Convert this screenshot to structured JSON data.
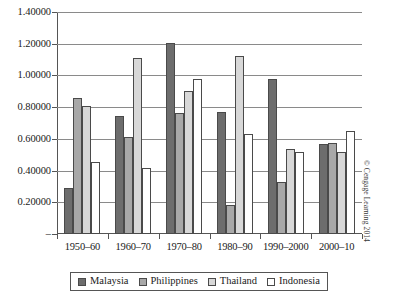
{
  "chart_data": {
    "type": "bar",
    "title": "",
    "subtitle": "",
    "xlabel": "",
    "ylabel": "",
    "categories": [
      "1950–60",
      "1960–70",
      "1970–80",
      "1980–90",
      "1990–2000",
      "2000–10"
    ],
    "series": [
      {
        "name": "Malaysia",
        "color": "#6d6d6d",
        "values": [
          0.29,
          0.745,
          1.205,
          0.77,
          0.98,
          0.565
        ]
      },
      {
        "name": "Philippines",
        "color": "#a8a8a8",
        "values": [
          0.855,
          0.61,
          0.765,
          0.18,
          0.33,
          0.575
        ]
      },
      {
        "name": "Thailand",
        "color": "#d8d8d8",
        "values": [
          0.805,
          1.11,
          0.9,
          1.12,
          0.535,
          0.515
        ]
      },
      {
        "name": "Indonesia",
        "color": "#ffffff",
        "values": [
          0.455,
          0.415,
          0.975,
          0.63,
          0.52,
          0.65
        ]
      }
    ],
    "ylim": [
      0,
      1.4
    ],
    "yticks": [
      0,
      0.2,
      0.4,
      0.6,
      0.8,
      1.0,
      1.2,
      1.4
    ],
    "ytick_labels": [
      "–",
      "0.20000",
      "0.40000",
      "0.60000",
      "0.80000",
      "1.00000",
      "1.20000",
      "1.40000"
    ],
    "grid": true,
    "legend_position": "bottom"
  },
  "legend": {
    "items": [
      {
        "label": "Malaysia",
        "color": "#6d6d6d"
      },
      {
        "label": "Philippines",
        "color": "#a8a8a8"
      },
      {
        "label": "Thailand",
        "color": "#d8d8d8"
      },
      {
        "label": "Indonesia",
        "color": "#ffffff"
      }
    ]
  },
  "credit": {
    "text": "© Cengage Learning 2014"
  }
}
